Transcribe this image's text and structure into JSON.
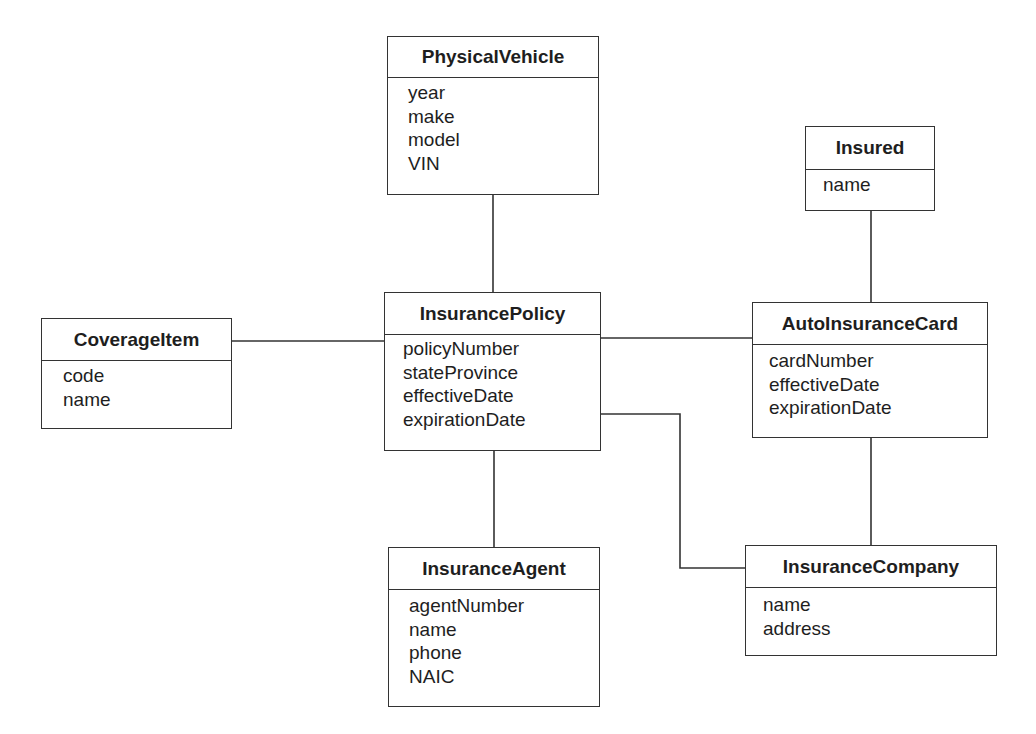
{
  "diagram": {
    "type": "class-diagram",
    "entities": {
      "physical_vehicle": {
        "name": "PhysicalVehicle",
        "attributes": [
          "year",
          "make",
          "model",
          "VIN"
        ]
      },
      "insured": {
        "name": "Insured",
        "attributes": [
          "name"
        ]
      },
      "coverage_item": {
        "name": "CoverageItem",
        "attributes": [
          "code",
          "name"
        ]
      },
      "insurance_policy": {
        "name": "InsurancePolicy",
        "attributes": [
          "policyNumber",
          "stateProvince",
          "effectiveDate",
          "expirationDate"
        ]
      },
      "auto_insurance_card": {
        "name": "AutoInsuranceCard",
        "attributes": [
          "cardNumber",
          "effectiveDate",
          "expirationDate"
        ]
      },
      "insurance_agent": {
        "name": "InsuranceAgent",
        "attributes": [
          "agentNumber",
          "name",
          "phone",
          "NAIC"
        ]
      },
      "insurance_company": {
        "name": "InsuranceCompany",
        "attributes": [
          "name",
          "address"
        ]
      }
    },
    "associations": [
      {
        "from": "PhysicalVehicle",
        "to": "InsurancePolicy"
      },
      {
        "from": "CoverageItem",
        "to": "InsurancePolicy"
      },
      {
        "from": "InsurancePolicy",
        "to": "AutoInsuranceCard"
      },
      {
        "from": "Insured",
        "to": "AutoInsuranceCard"
      },
      {
        "from": "InsurancePolicy",
        "to": "InsuranceAgent"
      },
      {
        "from": "InsurancePolicy",
        "to": "InsuranceCompany"
      },
      {
        "from": "AutoInsuranceCard",
        "to": "InsuranceCompany"
      }
    ],
    "colors": {
      "line": "#333333",
      "text": "#1e1e1e",
      "background": "#ffffff"
    }
  }
}
